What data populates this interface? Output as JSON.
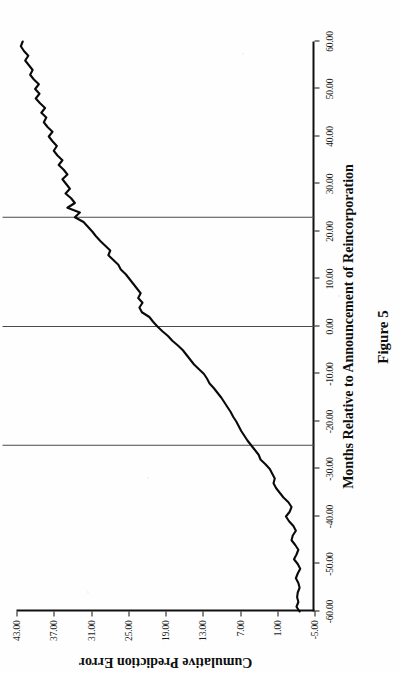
{
  "figure": {
    "caption": "Figure 5"
  },
  "chart_data": {
    "type": "line",
    "title": "",
    "xlabel": "Months Relative to Announcement of Reincorporation",
    "ylabel": "Cumulative Prediction Error",
    "xlim": [
      -60,
      60
    ],
    "ylim": [
      -5,
      43
    ],
    "grid": false,
    "legend": null,
    "xticks": [
      -60,
      -50,
      -40,
      -30,
      -20,
      -10,
      0,
      10,
      20,
      30,
      40,
      50,
      60
    ],
    "xticklabels": [
      "-60.00",
      "-50.00",
      "-40.00",
      "-30.00",
      "-20.00",
      "-10.00",
      "0.00",
      "10.00",
      "20.00",
      "30.00",
      "40.00",
      "50.00",
      "60.00"
    ],
    "yticks": [
      -5,
      1,
      7,
      13,
      19,
      25,
      31,
      37,
      43
    ],
    "yticklabels": [
      "-5.00",
      "1.00",
      "7.00",
      "13.00",
      "19.00",
      "25.00",
      "31.00",
      "37.00",
      "43.00"
    ],
    "reference_lines": [
      {
        "axis": "x",
        "value": -25
      },
      {
        "axis": "x",
        "value": 0
      },
      {
        "axis": "x",
        "value": 23
      }
    ],
    "series": [
      {
        "name": "Cumulative Prediction Error",
        "x": [
          -60,
          -59,
          -58,
          -57,
          -56,
          -55,
          -54,
          -53,
          -52,
          -51,
          -50,
          -49,
          -48,
          -47,
          -46,
          -45,
          -44,
          -43,
          -42,
          -41,
          -40,
          -39,
          -38,
          -37,
          -36,
          -35,
          -34,
          -33,
          -32,
          -31,
          -30,
          -29,
          -28,
          -27,
          -26,
          -25,
          -24,
          -23,
          -22,
          -21,
          -20,
          -19,
          -18,
          -17,
          -16,
          -15,
          -14,
          -13,
          -12,
          -11,
          -10,
          -9,
          -8,
          -7,
          -6,
          -5,
          -4,
          -3,
          -2,
          -1,
          0,
          1,
          2,
          3,
          4,
          5,
          6,
          7,
          8,
          9,
          10,
          11,
          12,
          13,
          14,
          15,
          16,
          17,
          18,
          19,
          20,
          21,
          22,
          23,
          24,
          25,
          26,
          27,
          28,
          29,
          30,
          31,
          32,
          33,
          34,
          35,
          36,
          37,
          38,
          39,
          40,
          41,
          42,
          43,
          44,
          45,
          46,
          47,
          48,
          49,
          50,
          51,
          52,
          53,
          54,
          55,
          56,
          57,
          58,
          59,
          60
        ],
        "y": [
          -2.6,
          -2.1,
          -2.4,
          -2.2,
          -2.3,
          -2.6,
          -2.4,
          -2.0,
          -2.3,
          -2.7,
          -2.3,
          -1.7,
          -2.1,
          -2.4,
          -1.9,
          -1.3,
          -1.5,
          -2.0,
          -1.6,
          -0.9,
          -0.4,
          -1.0,
          -1.3,
          -0.8,
          0.0,
          0.6,
          1.2,
          1.6,
          1.4,
          1.8,
          2.2,
          2.9,
          3.7,
          4.0,
          4.6,
          5.2,
          5.8,
          6.3,
          6.8,
          7.2,
          7.6,
          8.1,
          8.5,
          9.0,
          9.5,
          10.0,
          10.6,
          11.2,
          11.9,
          12.3,
          12.8,
          13.6,
          14.4,
          15.0,
          15.6,
          16.2,
          17.0,
          17.9,
          18.6,
          19.5,
          20.3,
          21.0,
          21.6,
          22.8,
          23.2,
          22.7,
          23.4,
          23.0,
          23.6,
          24.2,
          24.8,
          25.4,
          26.2,
          26.6,
          27.4,
          28.2,
          27.9,
          28.7,
          29.5,
          30.2,
          30.8,
          31.5,
          32.2,
          33.6,
          32.8,
          34.8,
          33.6,
          34.2,
          35.1,
          34.4,
          35.0,
          35.6,
          34.8,
          35.4,
          36.2,
          35.6,
          36.4,
          37.0,
          36.5,
          37.2,
          37.8,
          37.2,
          38.0,
          38.6,
          38.2,
          39.0,
          38.4,
          39.2,
          39.9,
          39.3,
          40.0,
          39.4,
          40.2,
          40.8,
          40.4,
          41.0,
          41.6,
          41.1,
          41.8,
          42.3,
          42.0
        ]
      }
    ]
  }
}
